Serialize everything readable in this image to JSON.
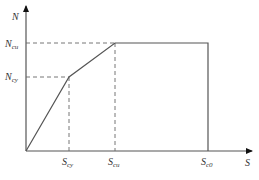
{
  "diagram": {
    "type": "load-displacement curve (trilinear / elastic-plastic)",
    "axes": {
      "y_label": "N",
      "x_label": "S"
    },
    "y_ticks": [
      {
        "main": "N",
        "sub": "cu",
        "label": "N_cu"
      },
      {
        "main": "N",
        "sub": "cy",
        "label": "N_cy"
      }
    ],
    "x_ticks": [
      {
        "main": "S",
        "sub": "cy",
        "label": "S_cy"
      },
      {
        "main": "S",
        "sub": "cu",
        "label": "S_cu"
      },
      {
        "main": "S",
        "sub": "c0",
        "label": "S_c0"
      }
    ],
    "curve_points": [
      {
        "x": "0",
        "y": "0"
      },
      {
        "x": "S_cy",
        "y": "N_cy"
      },
      {
        "x": "S_cu",
        "y": "N_cu"
      },
      {
        "x": "S_c0",
        "y": "N_cu"
      },
      {
        "x": "S_c0",
        "y": "0"
      }
    ],
    "colors": {
      "line": "#555555",
      "dash": "#666666",
      "text": "#333333"
    }
  }
}
